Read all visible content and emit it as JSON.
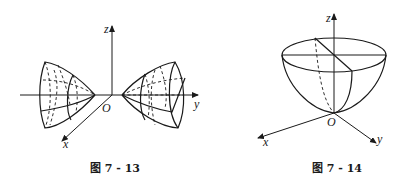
{
  "figures": [
    {
      "caption": "图 7 - 13",
      "axes": {
        "z": "z",
        "y": "y",
        "x": "x",
        "origin": "O"
      },
      "description": "Two cone-like surfaces (elliptic cone nappes) opening along the y-axis, apexes near the origin"
    },
    {
      "caption": "图 7 - 14",
      "axes": {
        "z": "z",
        "y": "y",
        "x": "x",
        "origin": "O"
      },
      "description": "Paraboloid opening upward along the z-axis, vertex at origin, with elliptical top rim"
    }
  ]
}
